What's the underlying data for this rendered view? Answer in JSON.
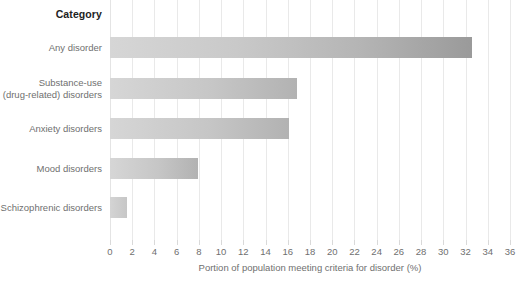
{
  "chart_data": {
    "type": "bar",
    "orientation": "horizontal",
    "title": "",
    "category_header": "Category",
    "categories": [
      "Any disorder",
      "Substance-use (drug-related) disorders",
      "Anxiety disorders",
      "Mood disorders",
      "Schizophrenic disorders"
    ],
    "category_lines": [
      [
        "Any disorder"
      ],
      [
        "Substance-use",
        "(drug-related) disorders"
      ],
      [
        "Anxiety disorders"
      ],
      [
        "Mood disorders"
      ],
      [
        "Schizophrenic disorders"
      ]
    ],
    "values": [
      32.6,
      16.8,
      16.1,
      7.9,
      1.5
    ],
    "xlabel": "Portion of population meeting criteria for disorder (%)",
    "ylabel": "",
    "xlim": [
      0,
      36
    ],
    "xticks": [
      0,
      2,
      4,
      6,
      8,
      10,
      12,
      14,
      16,
      18,
      20,
      22,
      24,
      26,
      28,
      30,
      32,
      34,
      36
    ],
    "xticklabels": [
      "0",
      "2",
      "4",
      "6",
      "8",
      "10",
      "12",
      "14",
      "16",
      "18",
      "20",
      "22",
      "24",
      "26",
      "28",
      "30",
      "32",
      "34",
      "36"
    ],
    "grid": true,
    "grid_axis": "x",
    "legend": false,
    "colors": {
      "bar_start": "#d6d6d6",
      "bar_end": "#9a9a9a",
      "gridline": "#e9e9e9",
      "tick": "#d9d9d9",
      "label_text": "#6f6f6f",
      "header_text": "#222222",
      "background": "#ffffff"
    }
  }
}
